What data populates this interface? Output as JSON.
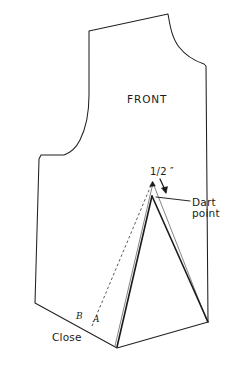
{
  "figure": {
    "type": "technical-line-drawing",
    "background_color": "#ffffff",
    "outline_color": "#231f20",
    "dart_new_color": "#000000",
    "dart_old_color": "#6e6e72",
    "dash_color": "#3a3a3a",
    "labels": {
      "front": "FRONT",
      "half_inch": "1/2 ″",
      "dart_line1": "Dart",
      "dart_line2": "point",
      "close": "Close",
      "point_b": "B",
      "point_a": "A"
    },
    "annotations": {
      "arrow_from_apex_to_dart_point": true,
      "leader_line_to_dart_label": true,
      "dashed_pivot_line_from_A_to_apex": true
    }
  },
  "geometry": {
    "units": "px",
    "canvas": [
      233,
      370
    ],
    "body_outline": "shoulder-neck-armhole-side-hem silhouette",
    "apex": [
      153,
      182
    ],
    "dart_point": [
      152,
      196
    ],
    "hem_notch": [
      117,
      348
    ],
    "side_bottom_right": [
      208,
      322
    ],
    "point_a": [
      95,
      322
    ],
    "point_b": [
      84,
      320
    ]
  }
}
